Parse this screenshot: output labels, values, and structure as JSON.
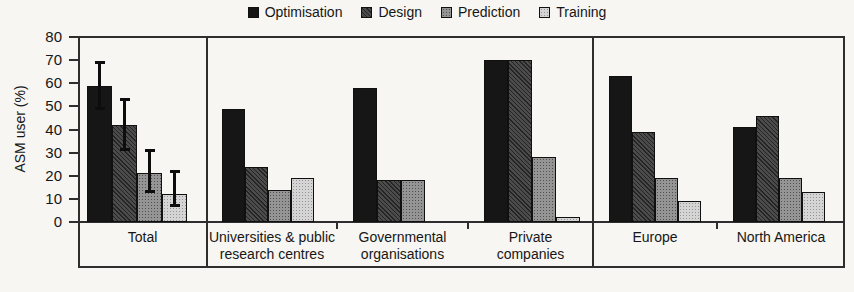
{
  "chart_data": {
    "type": "bar",
    "title": "",
    "xlabel": "",
    "ylabel": "ASM user (%)",
    "ylim": [
      0,
      80
    ],
    "yticks": [
      0,
      10,
      20,
      30,
      40,
      50,
      60,
      70,
      80
    ],
    "grid": false,
    "legend_position": "top-center",
    "categories": [
      "Total",
      "Universities & public research centres",
      "Governmental organisations",
      "Private companies",
      "Europe",
      "North America"
    ],
    "category_label_lines": [
      [
        "Total"
      ],
      [
        "Universities & public",
        "research centres"
      ],
      [
        "Governmental",
        "organisations"
      ],
      [
        "Private",
        "companies"
      ],
      [
        "Europe"
      ],
      [
        "North America"
      ]
    ],
    "panels": [
      {
        "categories": [
          "Total"
        ]
      },
      {
        "categories": [
          "Universities & public research centres",
          "Governmental organisations",
          "Private companies"
        ]
      },
      {
        "categories": [
          "Europe",
          "North America"
        ]
      }
    ],
    "series": [
      {
        "name": "Optimisation",
        "color": "#161616",
        "pattern": "solid",
        "values": [
          59,
          49,
          58,
          70,
          63,
          41
        ]
      },
      {
        "name": "Design",
        "color": "#424242",
        "pattern": "crosshatch",
        "values": [
          42,
          24,
          18,
          70,
          39,
          46
        ]
      },
      {
        "name": "Prediction",
        "color": "#959595",
        "pattern": "stipple",
        "values": [
          21,
          14,
          18,
          28,
          19,
          19
        ]
      },
      {
        "name": "Training",
        "color": "#d5d5d5",
        "pattern": "stipple-light",
        "values": [
          12,
          19,
          0,
          2,
          9,
          13
        ]
      }
    ],
    "error_bars": {
      "category": "Total",
      "note": "lo/hi whisker values per series, shown only on the Total group",
      "ranges": [
        [
          49,
          69
        ],
        [
          31,
          53
        ],
        [
          13,
          31
        ],
        [
          7,
          22
        ]
      ]
    }
  }
}
